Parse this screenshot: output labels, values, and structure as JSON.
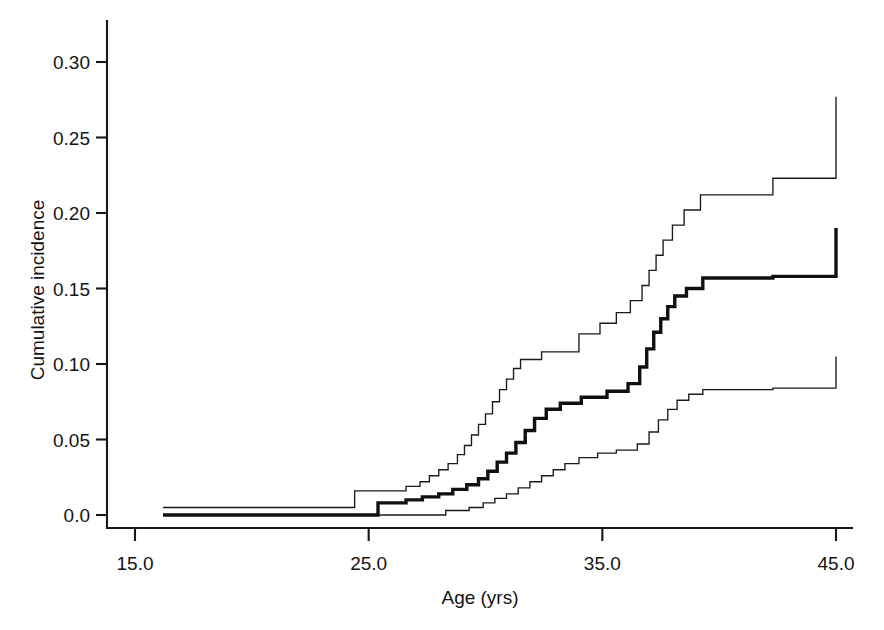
{
  "chart_data": {
    "type": "line",
    "subtype": "step-cumulative-incidence",
    "title": "",
    "xlabel": "Age (yrs)",
    "ylabel": "Cumulative incidence",
    "xlim": [
      13.0,
      45.9
    ],
    "ylim": [
      -0.008,
      0.328
    ],
    "xticks": [
      15.0,
      25.0,
      35.0,
      45.0
    ],
    "xtick_labels": [
      "15.0",
      "25.0",
      "35.0",
      "45.0"
    ],
    "yticks": [
      0.0,
      0.05,
      0.1,
      0.15,
      0.2,
      0.25,
      0.3
    ],
    "ytick_labels": [
      "0.0",
      "0.05",
      "0.10",
      "0.15",
      "0.20",
      "0.25",
      "0.30"
    ],
    "grid": false,
    "legend": null,
    "legend_position": "none",
    "colors": {
      "estimate": "#101010",
      "confidence_interval": "#1a1a1a",
      "axis": "#161616",
      "background": "#ffffff"
    },
    "series": [
      {
        "name": "Upper 95% confidence limit",
        "style": "thin step line",
        "x": [
          16.2,
          24.3,
          24.4,
          26.0,
          26.6,
          27.2,
          27.6,
          28.0,
          28.4,
          28.8,
          29.1,
          29.4,
          29.7,
          30.0,
          30.3,
          30.6,
          30.9,
          31.2,
          31.5,
          31.9,
          32.4,
          33.1,
          34.0,
          34.9,
          35.6,
          36.2,
          36.7,
          37.0,
          37.3,
          37.6,
          38.0,
          38.5,
          39.2,
          42.3,
          45.0
        ],
        "y": [
          0.005,
          0.005,
          0.016,
          0.016,
          0.019,
          0.022,
          0.026,
          0.03,
          0.034,
          0.04,
          0.046,
          0.053,
          0.06,
          0.067,
          0.075,
          0.083,
          0.09,
          0.097,
          0.103,
          0.103,
          0.108,
          0.108,
          0.12,
          0.127,
          0.134,
          0.142,
          0.152,
          0.162,
          0.172,
          0.182,
          0.192,
          0.202,
          0.212,
          0.223,
          0.277
        ]
      },
      {
        "name": "Cumulative incidence estimate",
        "style": "thick step line",
        "x": [
          16.2,
          24.3,
          25.4,
          26.6,
          27.3,
          28.0,
          28.6,
          29.2,
          29.7,
          30.1,
          30.5,
          30.9,
          31.3,
          31.7,
          32.1,
          32.6,
          33.2,
          34.1,
          35.2,
          36.1,
          36.6,
          36.9,
          37.2,
          37.5,
          37.8,
          38.1,
          38.6,
          39.3,
          42.3,
          45.0
        ],
        "y": [
          0.0,
          0.0,
          0.008,
          0.01,
          0.012,
          0.014,
          0.017,
          0.02,
          0.024,
          0.029,
          0.035,
          0.041,
          0.048,
          0.056,
          0.064,
          0.07,
          0.074,
          0.078,
          0.082,
          0.087,
          0.098,
          0.11,
          0.121,
          0.13,
          0.138,
          0.145,
          0.15,
          0.157,
          0.158,
          0.19
        ]
      },
      {
        "name": "Lower 95% confidence limit",
        "style": "thin step line",
        "x": [
          16.2,
          26.6,
          28.3,
          29.3,
          29.9,
          30.4,
          30.9,
          31.4,
          31.9,
          32.4,
          32.9,
          33.4,
          34.0,
          34.8,
          35.6,
          36.5,
          37.0,
          37.4,
          37.8,
          38.2,
          38.7,
          39.3,
          42.3,
          45.0
        ],
        "y": [
          0.0,
          0.0,
          0.003,
          0.005,
          0.008,
          0.011,
          0.014,
          0.018,
          0.022,
          0.026,
          0.03,
          0.034,
          0.038,
          0.041,
          0.043,
          0.047,
          0.055,
          0.063,
          0.07,
          0.076,
          0.08,
          0.083,
          0.084,
          0.105
        ]
      }
    ],
    "annotations": []
  },
  "axes": {
    "x_axis_title": "Age (yrs)",
    "y_axis_title": "Cumulative incidence",
    "x_tick_labels": [
      "15.0",
      "25.0",
      "35.0",
      "45.0"
    ],
    "y_tick_labels": [
      "0.30",
      "0.25",
      "0.20",
      "0.15",
      "0.10",
      "0.05",
      "0.0"
    ]
  }
}
